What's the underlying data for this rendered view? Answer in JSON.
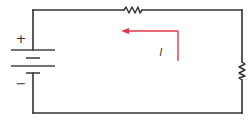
{
  "diagram": {
    "type": "series circuit",
    "components": [
      {
        "kind": "battery",
        "polarity_top": "+",
        "polarity_bottom": "−"
      },
      {
        "kind": "resistor",
        "position": "top"
      },
      {
        "kind": "resistor",
        "position": "right"
      }
    ],
    "current": {
      "label": "I",
      "direction": "counter-clockwise (leftward along top)"
    },
    "labels": {
      "plus": "+",
      "minus": "−",
      "current": "I"
    },
    "colors": {
      "wire": "#333333",
      "arrow": "#e0384a",
      "text": "#333333"
    }
  }
}
